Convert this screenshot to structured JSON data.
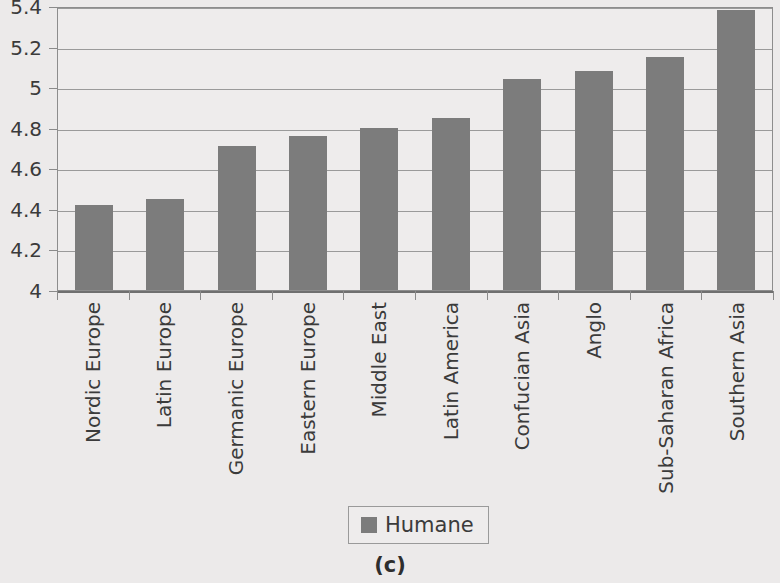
{
  "chart_data": {
    "type": "bar",
    "title": "",
    "subtitle": "",
    "xlabel": "",
    "ylabel": "",
    "ylim": [
      4,
      5.4
    ],
    "ytick_values": [
      4,
      4.2,
      4.4,
      4.6,
      4.8,
      5,
      5.2,
      5.4
    ],
    "ytick_labels": [
      "4",
      "4.2",
      "4.4",
      "4.6",
      "4.8",
      "5",
      "5.2",
      "5.4"
    ],
    "grid": true,
    "legend_position": "bottom-center",
    "categories": [
      "Nordic Europe",
      "Latin Europe",
      "Germanic Europe",
      "Eastern Europe",
      "Middle East",
      "Latin America",
      "Confucian Asia",
      "Anglo",
      "Sub-Saharan Africa",
      "Southern Asia"
    ],
    "series": [
      {
        "name": "Humane",
        "color": "#7c7c7c",
        "values": [
          4.42,
          4.45,
          4.71,
          4.76,
          4.8,
          4.85,
          5.04,
          5.08,
          5.15,
          5.38
        ]
      }
    ]
  },
  "legend": {
    "label": "Humane",
    "swatch_color": "#7c7c7c"
  },
  "caption": {
    "text": "(c)"
  },
  "colors": {
    "background": "#eceaea",
    "plot_background": "#eeecec",
    "bar": "#7c7c7c",
    "gridline": "#9a9a9a",
    "axis": "#8d8d8d",
    "text": "#3b3b3b"
  }
}
